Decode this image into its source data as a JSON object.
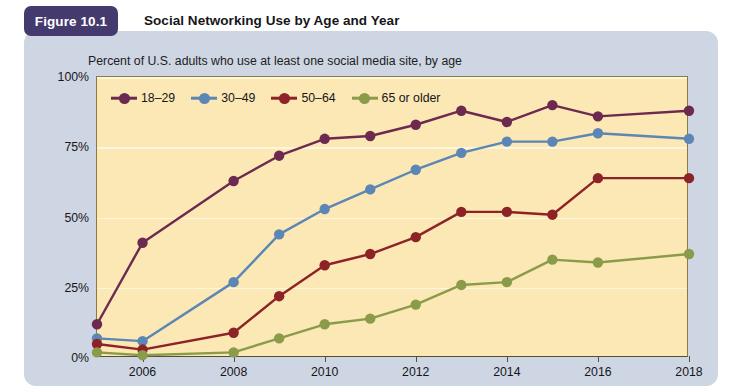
{
  "figure": {
    "badge": "Figure 10.1",
    "title": "Social Networking Use by Age and Year",
    "subtitle": "Percent of U.S. adults who use at least one social media site, by age"
  },
  "colors": {
    "panel_background": "#ced5e3",
    "plot_background": "#fbe8b4",
    "badge_background": "#443a6e",
    "gridline": "#fdf6de",
    "axis": "#55502f",
    "series_18_29": "#6d2a50",
    "series_30_49": "#5b86b5",
    "series_50_64": "#8e2327",
    "series_65_older": "#8a9b4a"
  },
  "chart_data": {
    "type": "line",
    "title": "Social Networking Use by Age and Year",
    "subtitle": "Percent of U.S. adults who use at least one social media site, by age",
    "xlabel": "",
    "ylabel": "",
    "x": [
      2005,
      2006,
      2008,
      2009,
      2010,
      2011,
      2012,
      2013,
      2014,
      2015,
      2016,
      2018
    ],
    "xtick_labels": [
      "2006",
      "2008",
      "2010",
      "2012",
      "2014",
      "2016",
      "2018"
    ],
    "xticks": [
      2006,
      2008,
      2010,
      2012,
      2014,
      2016,
      2018
    ],
    "xlim": [
      2005,
      2018
    ],
    "ytick_labels": [
      "0%",
      "25%",
      "50%",
      "75%",
      "100%"
    ],
    "yticks": [
      0,
      25,
      50,
      75,
      100
    ],
    "ylim": [
      0,
      100
    ],
    "grid": true,
    "legend_position": "top-left",
    "series": [
      {
        "name": "18–29",
        "color": "#6d2a50",
        "values": [
          12,
          41,
          63,
          72,
          78,
          79,
          83,
          88,
          84,
          90,
          86,
          88
        ]
      },
      {
        "name": "30–49",
        "color": "#5b86b5",
        "values": [
          7,
          6,
          27,
          44,
          53,
          60,
          67,
          73,
          77,
          77,
          80,
          78
        ]
      },
      {
        "name": "50–64",
        "color": "#8e2327",
        "values": [
          5,
          3,
          9,
          22,
          33,
          37,
          43,
          52,
          52,
          51,
          64,
          64
        ]
      },
      {
        "name": "65 or older",
        "color": "#8a9b4a",
        "values": [
          2,
          1,
          2,
          7,
          12,
          14,
          19,
          26,
          27,
          35,
          34,
          37
        ]
      }
    ]
  }
}
